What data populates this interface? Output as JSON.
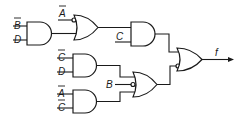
{
  "diagram": {
    "type": "logic-circuit",
    "output_label": "f",
    "gates": [
      {
        "id": "and1",
        "type": "AND",
        "inputs": [
          "B̄",
          "D"
        ]
      },
      {
        "id": "or1",
        "type": "OR",
        "inputs": [
          "Ā (inverted bubble)",
          "and1"
        ]
      },
      {
        "id": "and3",
        "type": "AND",
        "inputs": [
          "or1",
          "C"
        ]
      },
      {
        "id": "and2",
        "type": "AND",
        "inputs": [
          "C̄",
          "D"
        ]
      },
      {
        "id": "and4",
        "type": "AND",
        "inputs": [
          "Ā",
          "C̄"
        ]
      },
      {
        "id": "or2",
        "type": "OR",
        "inputs": [
          "and2",
          "B (inverted bubble)",
          "and4"
        ]
      },
      {
        "id": "or3",
        "type": "OR",
        "inputs": [
          "and3",
          "or2 (inverted bubble)"
        ],
        "output": "f"
      }
    ],
    "labels": {
      "and1_in1": "B",
      "and1_in2": "D",
      "or1_in1": "A",
      "and3_in2": "C",
      "and2_in1": "C",
      "and2_in2": "D",
      "and4_in1": "A",
      "and4_in2": "C",
      "or2_in2": "B",
      "output": "f"
    }
  }
}
